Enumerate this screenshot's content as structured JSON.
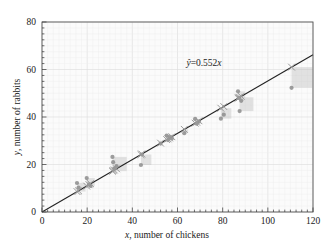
{
  "chart_data": {
    "type": "scatter",
    "title": "",
    "xlabel": "x, number of chickens",
    "ylabel": "y, number of rabbits",
    "xlim": [
      0,
      120
    ],
    "ylim": [
      0,
      80
    ],
    "xticks": [
      0,
      20,
      40,
      60,
      80,
      100,
      120
    ],
    "yticks": [
      0,
      20,
      40,
      60,
      80
    ],
    "xtick_labels": [
      "0",
      "20",
      "40",
      "60",
      "80",
      "100",
      "120"
    ],
    "ytick_labels": [
      "0",
      "20",
      "40",
      "60",
      "80"
    ],
    "minor_ticks": true,
    "grid": true,
    "legend": "none",
    "annotation": {
      "text": "ŷ = 0.552x",
      "x": 79,
      "y": 62
    },
    "fit_line": {
      "label": "ŷ = 0.552x",
      "slope": 0.552,
      "intercept": 0,
      "x_start": 0,
      "x_end": 120,
      "color": "#222222"
    },
    "series": [
      {
        "name": "observed",
        "marker": "circle",
        "color": "#8c8c8c",
        "points": [
          [
            15.5,
            12.2
          ],
          [
            16.2,
            10.3
          ],
          [
            19.8,
            14.3
          ],
          [
            20.8,
            11.6
          ],
          [
            21.5,
            11.0
          ],
          [
            31.2,
            23.2
          ],
          [
            31.5,
            21.0
          ],
          [
            32.0,
            18.3
          ],
          [
            33.0,
            19.3
          ],
          [
            43.8,
            19.8
          ],
          [
            44.2,
            24.2
          ],
          [
            52.5,
            28.8
          ],
          [
            55.2,
            32.2
          ],
          [
            55.8,
            30.3
          ],
          [
            56.5,
            31.5
          ],
          [
            57.5,
            31.0
          ],
          [
            63.0,
            33.2
          ],
          [
            67.8,
            39.2
          ],
          [
            68.5,
            37.2
          ],
          [
            69.5,
            38.0
          ],
          [
            79.2,
            39.3
          ],
          [
            80.5,
            41.0
          ],
          [
            86.8,
            50.8
          ],
          [
            87.2,
            48.0
          ],
          [
            87.5,
            42.5
          ],
          [
            88.2,
            46.8
          ],
          [
            110.5,
            52.3
          ]
        ]
      },
      {
        "name": "predicted",
        "marker": "x",
        "color": "#9a9a9a",
        "points": [
          [
            15.5,
            8.6
          ],
          [
            16.2,
            8.9
          ],
          [
            19.8,
            10.9
          ],
          [
            20.8,
            11.5
          ],
          [
            21.5,
            11.9
          ],
          [
            31.2,
            17.2
          ],
          [
            31.5,
            17.4
          ],
          [
            32.0,
            17.7
          ],
          [
            33.0,
            18.2
          ],
          [
            43.8,
            24.2
          ],
          [
            44.2,
            24.4
          ],
          [
            52.5,
            29.0
          ],
          [
            55.2,
            30.5
          ],
          [
            55.8,
            30.8
          ],
          [
            56.5,
            31.2
          ],
          [
            57.5,
            31.7
          ],
          [
            63.0,
            34.8
          ],
          [
            67.8,
            37.4
          ],
          [
            68.5,
            37.8
          ],
          [
            69.5,
            38.4
          ],
          [
            79.2,
            43.7
          ],
          [
            80.5,
            44.4
          ],
          [
            86.8,
            47.9
          ],
          [
            87.2,
            48.1
          ],
          [
            87.5,
            48.3
          ],
          [
            88.2,
            48.7
          ],
          [
            110.5,
            61.0
          ]
        ]
      }
    ],
    "residual_boxes": [
      [
        15.5,
        8.6,
        12.2
      ],
      [
        19.8,
        10.9,
        14.3
      ],
      [
        31.2,
        17.2,
        23.2
      ],
      [
        32.0,
        17.7,
        18.3
      ],
      [
        44.2,
        24.4,
        24.2
      ],
      [
        43.8,
        24.2,
        19.8
      ],
      [
        55.2,
        30.5,
        32.2
      ],
      [
        56.5,
        31.2,
        31.5
      ],
      [
        63.0,
        34.8,
        33.2
      ],
      [
        67.8,
        37.4,
        39.2
      ],
      [
        69.5,
        38.4,
        38.0
      ],
      [
        79.2,
        43.7,
        39.3
      ],
      [
        86.8,
        47.9,
        50.8
      ],
      [
        87.5,
        48.3,
        42.5
      ],
      [
        110.5,
        61.0,
        52.3
      ]
    ]
  },
  "axes": {
    "x_axis_name": "x-axis",
    "y_axis_name": "y-axis"
  }
}
